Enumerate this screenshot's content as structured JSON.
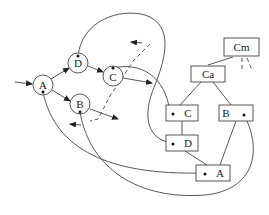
{
  "diagram": {
    "type": "graph-and-tree",
    "left_graph": {
      "nodes": [
        {
          "id": "A",
          "label": "A",
          "shape": "circle"
        },
        {
          "id": "D",
          "label": "D",
          "shape": "circle"
        },
        {
          "id": "C",
          "label": "C",
          "shape": "circle"
        },
        {
          "id": "B",
          "label": "B",
          "shape": "circle"
        }
      ],
      "edges": [
        {
          "from": "input",
          "to": "A"
        },
        {
          "from": "A",
          "to": "D"
        },
        {
          "from": "A",
          "to": "B"
        },
        {
          "from": "D",
          "to": "C"
        },
        {
          "from": "C",
          "to": "out"
        },
        {
          "from": "B",
          "to": "out"
        }
      ]
    },
    "right_tree": {
      "nodes": [
        {
          "id": "Cm",
          "label": "Cm",
          "shape": "box"
        },
        {
          "id": "Ca",
          "label": "Ca",
          "shape": "box"
        },
        {
          "id": "Ct",
          "label": "C",
          "shape": "box"
        },
        {
          "id": "Bt",
          "label": "B",
          "shape": "box"
        },
        {
          "id": "Dt",
          "label": "D",
          "shape": "box"
        },
        {
          "id": "At",
          "label": "A",
          "shape": "box"
        }
      ],
      "edges": [
        {
          "from": "Cm",
          "to": "Ca"
        },
        {
          "from": "Ca",
          "to": "C"
        },
        {
          "from": "Ca",
          "to": "B"
        },
        {
          "from": "C",
          "to": "D"
        },
        {
          "from": "D",
          "to": "A"
        },
        {
          "from": "B",
          "to": "A"
        }
      ]
    },
    "labels": {
      "circle_A": "A",
      "circle_D": "D",
      "circle_C": "C",
      "circle_B": "B",
      "box_Cm": "Cm",
      "box_Ca": "Ca",
      "box_C": "C",
      "box_B": "B",
      "box_D": "D",
      "box_A": "A"
    }
  }
}
